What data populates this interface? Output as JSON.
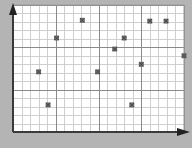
{
  "chart_data": {
    "type": "scatter",
    "title": "",
    "xlabel": "",
    "ylabel": "",
    "xlim": [
      0,
      20
    ],
    "ylim": [
      0,
      15
    ],
    "grid": {
      "on": true,
      "minor_step": 1,
      "major_step_x": 5,
      "major_step_y": 5
    },
    "legend": null,
    "marker": "small square with x",
    "series": [
      {
        "name": "points",
        "x": [
          8.1,
          16.0,
          17.9,
          5.1,
          13.0,
          11.9,
          20.0,
          15.0,
          3.0,
          9.9,
          4.1,
          13.9
        ],
        "y": [
          13.2,
          13.1,
          13.1,
          11.1,
          11.1,
          9.8,
          9.0,
          8.0,
          7.1,
          7.1,
          3.2,
          3.2
        ]
      }
    ]
  },
  "style": {
    "background": "#b4b4b4",
    "plot_bg": "#ffffff",
    "minor_grid": "#cfcfcf",
    "major_grid": "#8a8a8a",
    "axis": "#3a3a3a",
    "marker": "#555555",
    "border": "#9a9a9a"
  }
}
